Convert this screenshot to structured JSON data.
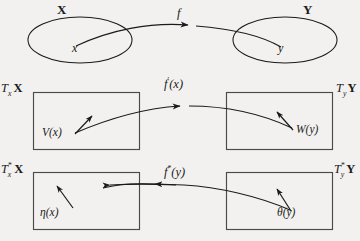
{
  "figure": {
    "kind": "commutative-diagram",
    "background_color": "#f2f1ef",
    "ink_color": "#1a1a1a"
  },
  "row_sets": {
    "left_set_label": "X",
    "right_set_label": "Y",
    "left_point_label": "x",
    "right_point_label": "y",
    "map_label": "f"
  },
  "row_tangent": {
    "left_space_T": "T",
    "left_space_sub": "x",
    "left_space_set": "X",
    "right_space_T": "T",
    "right_space_sub": "y",
    "right_space_set": "Y",
    "map_f": "f",
    "map_prime": "′",
    "map_arg": "(x)",
    "left_vector": "V(x)",
    "right_vector": "W(y)"
  },
  "row_cotangent": {
    "left_space_T": "T",
    "left_space_sub": "x",
    "left_space_sup": "*",
    "left_space_set": "X",
    "right_space_T": "T",
    "right_space_sub": "y",
    "right_space_sup": "*",
    "right_space_set": "Y",
    "map_f": "f",
    "map_sup": "*",
    "map_arg": "(y)",
    "left_covector": "η(x)",
    "right_covector": "θ(y)"
  }
}
